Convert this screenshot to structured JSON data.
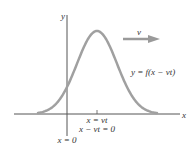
{
  "diagram": {
    "colors": {
      "axis": "#555555",
      "curve": "#a0a0a0",
      "arrow": "#9a9a9a",
      "text": "#333333"
    },
    "labels": {
      "y_axis": "y",
      "x_axis": "x",
      "velocity": "v",
      "function": "y = f(x − vt)",
      "peak_position": "x = vt",
      "peak_condition": "x − vt = 0",
      "origin": "x = 0"
    }
  }
}
